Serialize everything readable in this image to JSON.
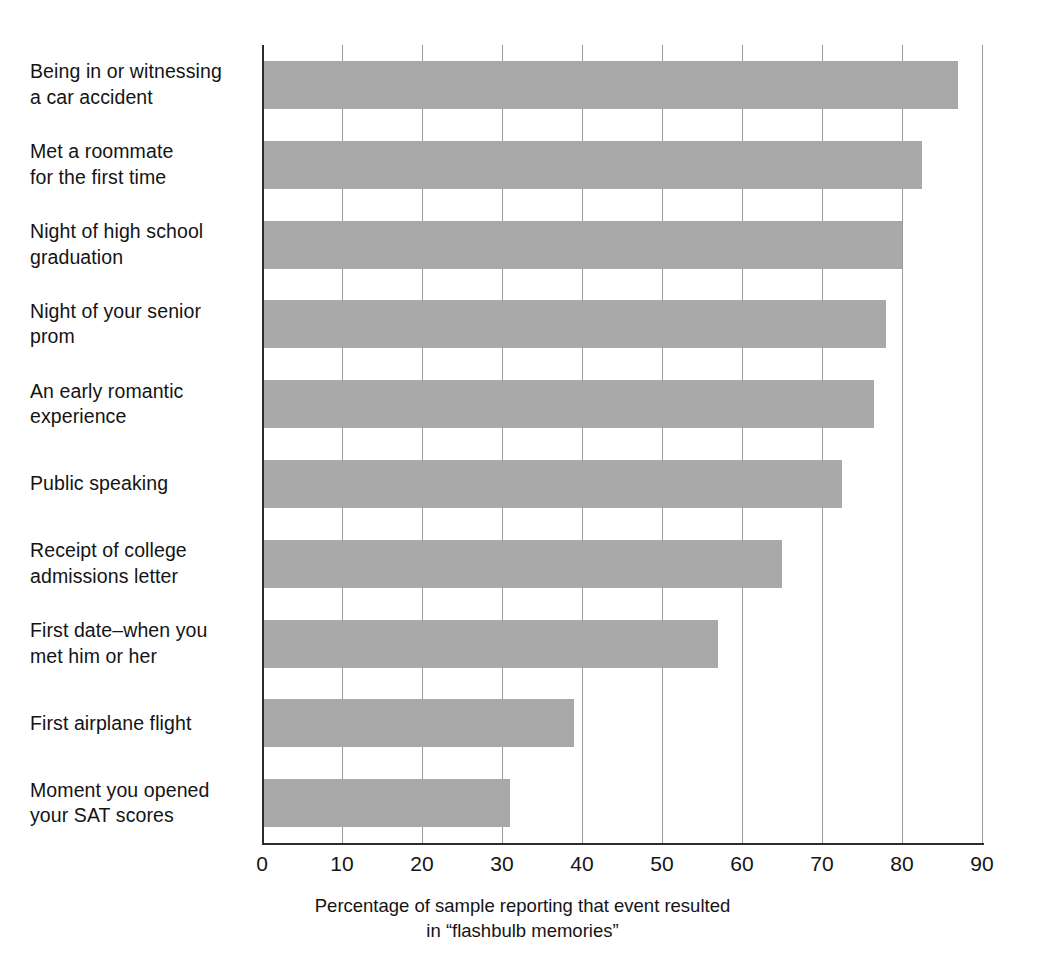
{
  "chart_data": {
    "type": "bar",
    "orientation": "horizontal",
    "title": "",
    "xlabel": "Percentage of sample reporting that event resulted in “flashbulb memories”",
    "xlabel_lines": [
      "Percentage of sample reporting that event resulted",
      "in “flashbulb memories”"
    ],
    "ylabel": "",
    "categories": [
      "Being in or witnessing\na car accident",
      "Met a roommate\nfor the first time",
      "Night of high school\ngraduation",
      "Night of your senior\nprom",
      "An early romantic\nexperience",
      "Public speaking",
      "Receipt of college\nadmissions letter",
      "First date–when you\nmet him or her",
      "First airplane flight",
      "Moment you opened\nyour SAT scores"
    ],
    "values": [
      87,
      82.5,
      80,
      78,
      76.5,
      72.5,
      65,
      57,
      39,
      31
    ],
    "xlim": [
      0,
      90
    ],
    "xticks": [
      0,
      10,
      20,
      30,
      40,
      50,
      60,
      70,
      80,
      90
    ],
    "xtick_labels": [
      "0",
      "10",
      "20",
      "30",
      "40",
      "50",
      "60",
      "70",
      "80",
      "90"
    ],
    "grid": "vertical",
    "legend": "none",
    "bar_color": "#a9a9a9",
    "axis_color": "#2b2b2b",
    "gridline_color": "#9a9a9a",
    "background_color": "#ffffff"
  }
}
